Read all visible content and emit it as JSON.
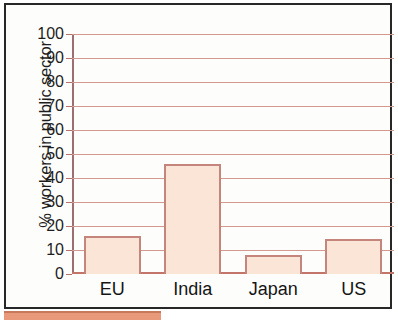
{
  "chart_data": {
    "type": "bar",
    "title": "",
    "xlabel": "",
    "ylabel": "% workers in public sector",
    "categories": [
      "EU",
      "India",
      "Japan",
      "US"
    ],
    "values": [
      16,
      46,
      8,
      14.5
    ],
    "ylim": [
      0,
      100
    ],
    "ytick_labels": [
      "0",
      "10",
      "20",
      "30",
      "40",
      "50",
      "60",
      "70",
      "80",
      "90",
      "100"
    ],
    "ytick_values": [
      0,
      10,
      20,
      30,
      40,
      50,
      60,
      70,
      80,
      90,
      100
    ],
    "grid": true,
    "legend": "none",
    "series": [
      {
        "name": "% workers in public sector",
        "values": [
          16,
          46,
          8,
          14.5
        ]
      }
    ],
    "colors": {
      "bar_fill": "#fae5d7",
      "bar_border": "#c4857d",
      "gridline": "#d4998f",
      "axis": "#9e6f72",
      "baseline": "#c4756a",
      "text": "#1d1d1d",
      "frame": "#272727",
      "bottom_rule": "#e8997a",
      "background": "#fdfdfc"
    }
  }
}
